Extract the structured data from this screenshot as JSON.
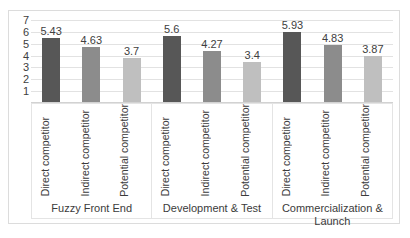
{
  "chart_data": {
    "type": "bar",
    "title": "",
    "subtitle": "",
    "xlabel": "",
    "ylabel": "",
    "ylim": [
      0,
      7
    ],
    "grid": true,
    "legend_position": "none",
    "axis": {
      "y_ticks": [
        "7",
        "6",
        "5",
        "4",
        "3",
        "2",
        "1"
      ],
      "y_tick_values": [
        7,
        6,
        5,
        4,
        3,
        2,
        1
      ]
    },
    "categories": [
      "Fuzzy Front End",
      "Development & Test",
      "Commercialization & Launch"
    ],
    "series": [
      {
        "name": "Direct competitor",
        "color": "#575757",
        "values": [
          5.43,
          5.6,
          5.93
        ]
      },
      {
        "name": "Indirect competitor",
        "color": "#8c8c8c",
        "values": [
          4.63,
          4.27,
          4.83
        ]
      },
      {
        "name": "Potential competitor",
        "color": "#bfbfbf",
        "values": [
          3.7,
          3.4,
          3.87
        ]
      }
    ],
    "groups": [
      {
        "label": "Fuzzy Front End",
        "bars": [
          {
            "series": "Direct competitor",
            "value": 5.43,
            "data_label": "5.43",
            "color": "#575757"
          },
          {
            "series": "Indirect competitor",
            "value": 4.63,
            "data_label": "4.63",
            "color": "#8c8c8c"
          },
          {
            "series": "Potential competitor",
            "value": 3.7,
            "data_label": "3.7",
            "color": "#bfbfbf"
          }
        ]
      },
      {
        "label": "Development & Test",
        "bars": [
          {
            "series": "Direct competitor",
            "value": 5.6,
            "data_label": "5.6",
            "color": "#575757"
          },
          {
            "series": "Indirect competitor",
            "value": 4.27,
            "data_label": "4.27",
            "color": "#8c8c8c"
          },
          {
            "series": "Potential competitor",
            "value": 3.4,
            "data_label": "3.4",
            "color": "#bfbfbf"
          }
        ]
      },
      {
        "label": "Commercialization & Launch",
        "bars": [
          {
            "series": "Direct competitor",
            "value": 5.93,
            "data_label": "5.93",
            "color": "#575757"
          },
          {
            "series": "Indirect competitor",
            "value": 4.83,
            "data_label": "4.83",
            "color": "#8c8c8c"
          },
          {
            "series": "Potential competitor",
            "value": 3.87,
            "data_label": "3.87",
            "color": "#bfbfbf"
          }
        ]
      }
    ],
    "colors": {
      "direct": "#575757",
      "indirect": "#8c8c8c",
      "potential": "#bfbfbf",
      "gridline": "#e2e2e2",
      "frame": "#dcdcdc",
      "text": "#3b3b3b"
    }
  }
}
